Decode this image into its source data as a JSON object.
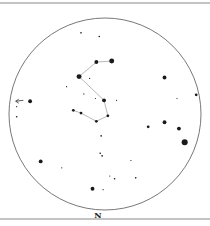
{
  "chart": {
    "title": "",
    "orientation_label": "N",
    "colors": {
      "stars": "#1a1a1a",
      "circle": "#555555",
      "lines": "#9a9a9a",
      "border": "#888888",
      "arrow": "#333333"
    },
    "stars": [
      {
        "id": "s1",
        "ra": -25,
        "dec": 89,
        "mag": 6
      },
      {
        "id": "s2",
        "ra": -6,
        "dec": 85,
        "mag": 6
      },
      {
        "id": "s3",
        "ra": -9,
        "dec": 57,
        "mag": 4
      },
      {
        "id": "s4",
        "ra": 7,
        "dec": 58,
        "mag": 3
      },
      {
        "id": "s5",
        "ra": -27,
        "dec": 41,
        "mag": 3
      },
      {
        "id": "s6",
        "ra": -16,
        "dec": 39,
        "mag": 7
      },
      {
        "id": "s7",
        "ra": -40,
        "dec": 30,
        "mag": 7
      },
      {
        "id": "s8",
        "ra": -22,
        "dec": 22,
        "mag": 7
      },
      {
        "id": "s9",
        "ra": -10,
        "dec": 17,
        "mag": 7
      },
      {
        "id": "s10",
        "ra": -1,
        "dec": 15,
        "mag": 4
      },
      {
        "id": "s11",
        "ra": 12,
        "dec": 15,
        "mag": 7
      },
      {
        "id": "s12",
        "ra": -33,
        "dec": 4,
        "mag": 5
      },
      {
        "id": "s13",
        "ra": -25,
        "dec": 1,
        "mag": 5
      },
      {
        "id": "s14",
        "ra": 3,
        "dec": -2,
        "mag": 5
      },
      {
        "id": "s15",
        "ra": -9,
        "dec": -8,
        "mag": 5
      },
      {
        "id": "s16",
        "ra": 62,
        "dec": 40,
        "mag": 4
      },
      {
        "id": "s17",
        "ra": 75,
        "dec": 17,
        "mag": 7
      },
      {
        "id": "s18",
        "ra": 95,
        "dec": 21,
        "mag": 5
      },
      {
        "id": "s19",
        "ra": -78,
        "dec": 14,
        "mag": 4
      },
      {
        "id": "s20",
        "ra": -92,
        "dec": 8,
        "mag": 7
      },
      {
        "id": "s21",
        "ra": -92,
        "dec": -3,
        "mag": 6
      },
      {
        "id": "s22",
        "ra": 45,
        "dec": -14,
        "mag": 5
      },
      {
        "id": "s23",
        "ra": 62,
        "dec": -9,
        "mag": 4
      },
      {
        "id": "s24",
        "ra": 77,
        "dec": -16,
        "mag": 4
      },
      {
        "id": "s25",
        "ra": 83,
        "dec": -31,
        "mag": 2
      },
      {
        "id": "s26",
        "ra": -4,
        "dec": -24,
        "mag": 6
      },
      {
        "id": "s27",
        "ra": -5,
        "dec": -43,
        "mag": 6
      },
      {
        "id": "s28",
        "ra": -3,
        "dec": -46,
        "mag": 6
      },
      {
        "id": "s29",
        "ra": 27,
        "dec": -51,
        "mag": 7
      },
      {
        "id": "s30",
        "ra": -67,
        "dec": -52,
        "mag": 4
      },
      {
        "id": "s31",
        "ra": -45,
        "dec": -59,
        "mag": 7
      },
      {
        "id": "s32",
        "ra": 10,
        "dec": -71,
        "mag": 6
      },
      {
        "id": "s33",
        "ra": 5,
        "dec": -68,
        "mag": 7
      },
      {
        "id": "s34",
        "ra": 32,
        "dec": -70,
        "mag": 6
      },
      {
        "id": "s35",
        "ra": -13,
        "dec": -82,
        "mag": 4
      },
      {
        "id": "s36",
        "ra": -2,
        "dec": -83,
        "mag": 7
      }
    ],
    "lines": [
      [
        "s3",
        "s4"
      ],
      [
        "s5",
        "s3"
      ],
      [
        "s5",
        "s10"
      ],
      [
        "s10",
        "s14"
      ],
      [
        "s14",
        "s15"
      ],
      [
        "s12",
        "s13"
      ],
      [
        "s13",
        "s15"
      ]
    ],
    "arrow": {
      "from_ra": -93,
      "from_dec": 14,
      "to_ra": -85,
      "to_dec": 15
    }
  }
}
